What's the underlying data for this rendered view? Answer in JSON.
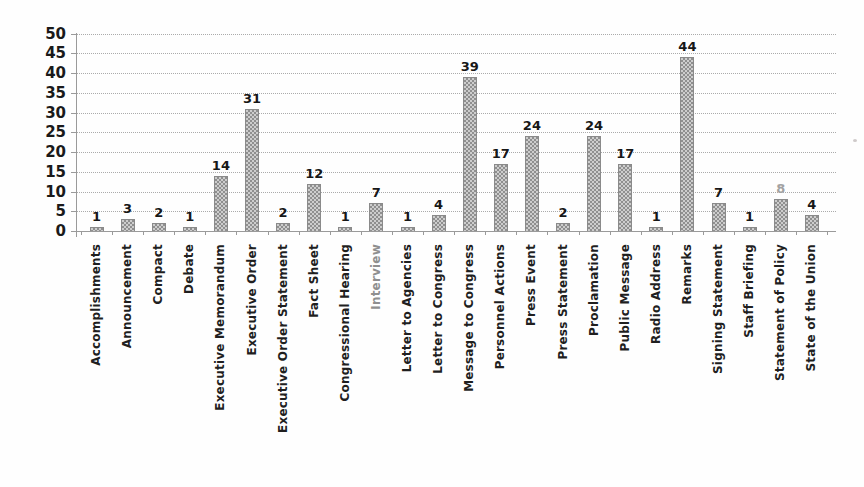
{
  "chart_data": {
    "type": "bar",
    "title": "",
    "xlabel": "",
    "ylabel": "",
    "ylim": [
      0,
      50
    ],
    "ytick_step": 5,
    "ytick_labels": [
      "0",
      "5",
      "10",
      "15",
      "20",
      "25",
      "30",
      "35",
      "40",
      "45",
      "50"
    ],
    "grid": "horizontal-dotted",
    "legend_position": "none",
    "bar_color": "#a9a9a9",
    "bar_border_color": "#8a8a8a",
    "grid_color": "#ababab",
    "axis_color": "#9a9a9a",
    "value_label_color": "#171717",
    "categories": [
      "Accomplishments",
      "Announcement",
      "Compact",
      "Debate",
      "Executive Memorandum",
      "Executive Order",
      "Executive Order Statement",
      "Fact Sheet",
      "Congressional Hearing",
      "Interview",
      "Letter to Agencies",
      "Letter to Congress",
      "Message to Congress",
      "Personnel Actions",
      "Press Event",
      "Press Statement",
      "Proclamation",
      "Public Message",
      "Radio Address",
      "Remarks",
      "Signing Statement",
      "Staff Briefing",
      "Statement of Policy",
      "State of the Union"
    ],
    "values": [
      1,
      3,
      2,
      1,
      14,
      31,
      2,
      12,
      1,
      7,
      1,
      4,
      39,
      17,
      24,
      2,
      24,
      17,
      1,
      44,
      7,
      1,
      8,
      4
    ],
    "faint_value_label_indexes": [
      22
    ],
    "faint_category_label_indexes": [
      9
    ]
  }
}
